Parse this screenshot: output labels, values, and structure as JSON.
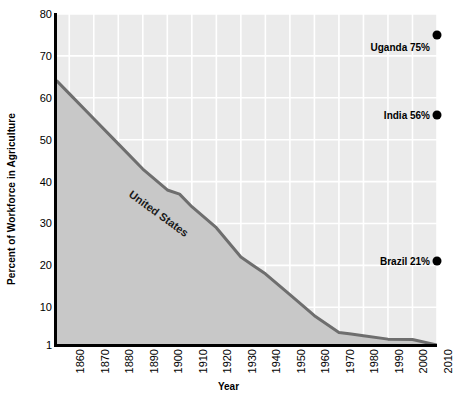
{
  "chart_data": {
    "type": "area",
    "title": "",
    "xlabel": "Year",
    "ylabel": "Percent of Workforce in Agriculture",
    "xlim": [
      1855,
      2010
    ],
    "ylim": [
      1,
      80
    ],
    "grid": true,
    "legend": "none",
    "background_color": "#ebebeb",
    "gridline_color": "#ffffff",
    "area_fill_color": "#c8c8c8",
    "line_color": "#6e6e6e",
    "axis_color": "#000000",
    "marker_color": "#000000",
    "x_ticks": [
      1860,
      1870,
      1880,
      1890,
      1900,
      1910,
      1920,
      1930,
      1940,
      1950,
      1960,
      1970,
      1980,
      1990,
      2000,
      2010
    ],
    "y_ticks": [
      1,
      10,
      20,
      30,
      40,
      50,
      60,
      70,
      80
    ],
    "series": [
      {
        "name": "United States",
        "label": "United States",
        "x": [
          1855,
          1860,
          1870,
          1880,
          1890,
          1900,
          1905,
          1910,
          1920,
          1930,
          1935,
          1940,
          1950,
          1960,
          1970,
          1975,
          1980,
          1990,
          2000,
          2010
        ],
        "values": [
          64,
          61,
          55,
          49,
          43,
          38,
          37,
          34,
          29,
          22,
          20,
          18,
          13,
          8,
          4,
          3.6,
          3.2,
          2.4,
          2.3,
          1
        ]
      }
    ],
    "annotations": [
      {
        "label": "Uganda 75%",
        "country": "Uganda",
        "value": 75,
        "year": 2010
      },
      {
        "label": "India 56%",
        "country": "India",
        "value": 56,
        "year": 2010
      },
      {
        "label": "Brazil 21%",
        "country": "Brazil",
        "value": 21,
        "year": 2010
      }
    ]
  }
}
